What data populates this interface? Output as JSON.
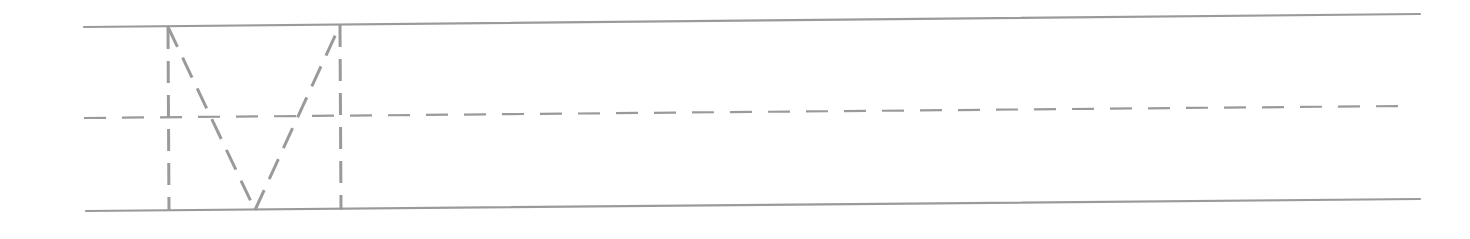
{
  "worksheet": {
    "type": "handwriting-practice-line",
    "letter": "M",
    "letter_style": "dashed-trace",
    "line_color": "#9a9a9a",
    "background": "#ffffff",
    "top_line": {
      "x1": 84,
      "y1": 27,
      "x2": 1420,
      "y2": 14
    },
    "mid_line": {
      "x1": 84,
      "y1": 118,
      "x2": 1402,
      "y2": 106,
      "dash": "22 16"
    },
    "bottom_line": {
      "x1": 86,
      "y1": 211,
      "x2": 1420,
      "y2": 199
    },
    "glyph": {
      "left_stem": {
        "x1": 168,
        "y1": 27,
        "x2": 169,
        "y2": 211
      },
      "left_diagonal": {
        "x1": 168,
        "y1": 27,
        "x2": 255,
        "y2": 210
      },
      "right_diagonal": {
        "x1": 255,
        "y1": 210,
        "x2": 340,
        "y2": 25
      },
      "right_stem": {
        "x1": 340,
        "y1": 25,
        "x2": 341,
        "y2": 210
      },
      "dash": "22 12"
    }
  }
}
